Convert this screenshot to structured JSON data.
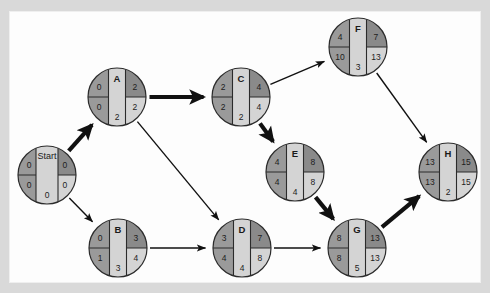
{
  "figure": {
    "type": "project-network-diagram",
    "title": "",
    "background": "#d9d9d9",
    "panel_background": "#fdfdfd"
  },
  "legend": {
    "quadrants": [
      "earliest-start",
      "earliest-finish",
      "latest-start",
      "latest-finish"
    ],
    "center_bottom": "duration"
  },
  "colors": {
    "quadrant_top_left": "#9a9a9a",
    "quadrant_top_right": "#8a8a8a",
    "quadrant_bottom_left": "#9a9a9a",
    "quadrant_bottom_right": "#d4d4d4",
    "center_band": "#d4d4d4",
    "edge": "#111111",
    "outline": "#2b2b2b"
  },
  "nodes": [
    {
      "id": "start",
      "label": "Start",
      "cx": 47,
      "cy": 175,
      "r": 29,
      "es": "0",
      "ef": "0",
      "ls": "0",
      "lf": "0",
      "duration": "0",
      "is_start": true
    },
    {
      "id": "A",
      "label": "A",
      "cx": 117,
      "cy": 97,
      "r": 29,
      "es": "0",
      "ef": "2",
      "ls": "0",
      "lf": "2",
      "duration": "2",
      "is_start": false
    },
    {
      "id": "B",
      "label": "B",
      "cx": 118,
      "cy": 248,
      "r": 29,
      "es": "0",
      "ef": "3",
      "ls": "1",
      "lf": "4",
      "duration": "3",
      "is_start": false
    },
    {
      "id": "C",
      "label": "C",
      "cx": 241,
      "cy": 97,
      "r": 29,
      "es": "2",
      "ef": "4",
      "ls": "2",
      "lf": "4",
      "duration": "2",
      "is_start": false
    },
    {
      "id": "D",
      "label": "D",
      "cx": 242,
      "cy": 248,
      "r": 29,
      "es": "3",
      "ef": "7",
      "ls": "4",
      "lf": "8",
      "duration": "4",
      "is_start": false
    },
    {
      "id": "E",
      "label": "E",
      "cx": 295,
      "cy": 172,
      "r": 29,
      "es": "4",
      "ef": "8",
      "ls": "4",
      "lf": "8",
      "duration": "4",
      "is_start": false
    },
    {
      "id": "F",
      "label": "F",
      "cx": 358,
      "cy": 47,
      "r": 29,
      "es": "4",
      "ef": "7",
      "ls": "10",
      "lf": "13",
      "duration": "3",
      "is_start": false
    },
    {
      "id": "G",
      "label": "G",
      "cx": 357,
      "cy": 248,
      "r": 29,
      "es": "8",
      "ef": "13",
      "ls": "8",
      "lf": "13",
      "duration": "5",
      "is_start": false
    },
    {
      "id": "H",
      "label": "H",
      "cx": 448,
      "cy": 172,
      "r": 29,
      "es": "13",
      "ef": "15",
      "ls": "13",
      "lf": "15",
      "duration": "2",
      "is_start": false
    }
  ],
  "edges": [
    {
      "id": "start-a",
      "from": "start",
      "to": "A",
      "critical": true
    },
    {
      "id": "start-b",
      "from": "start",
      "to": "B",
      "critical": false
    },
    {
      "id": "a-c",
      "from": "A",
      "to": "C",
      "critical": true
    },
    {
      "id": "a-d",
      "from": "A",
      "to": "D",
      "critical": false
    },
    {
      "id": "b-d",
      "from": "B",
      "to": "D",
      "critical": false
    },
    {
      "id": "c-f",
      "from": "C",
      "to": "F",
      "critical": false
    },
    {
      "id": "c-e",
      "from": "C",
      "to": "E",
      "critical": true
    },
    {
      "id": "d-g",
      "from": "D",
      "to": "G",
      "critical": false
    },
    {
      "id": "e-g",
      "from": "E",
      "to": "G",
      "critical": true
    },
    {
      "id": "f-h",
      "from": "F",
      "to": "H",
      "critical": false
    },
    {
      "id": "g-h",
      "from": "G",
      "to": "H",
      "critical": true
    }
  ],
  "critical_path": [
    "start",
    "A",
    "C",
    "E",
    "G",
    "H"
  ]
}
